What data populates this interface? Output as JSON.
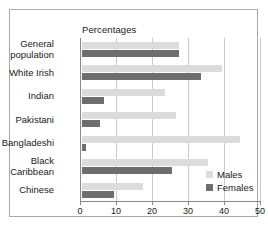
{
  "chart_data": {
    "type": "bar",
    "orientation": "horizontal",
    "title": "Percentages",
    "xlabel": "",
    "ylabel": "",
    "xlim": [
      0,
      50
    ],
    "xticks": [
      0,
      10,
      20,
      30,
      40,
      50
    ],
    "grid": true,
    "legend_position": "inside-right-bottom",
    "categories": [
      "General population",
      "White Irish",
      "Indian",
      "Pakistani",
      "Bangladeshi",
      "Black Caribbean",
      "Chinese"
    ],
    "category_lines": [
      [
        "General",
        "population"
      ],
      [
        "White Irish"
      ],
      [
        "Indian"
      ],
      [
        "Pakistani"
      ],
      [
        "Bangladeshi"
      ],
      [
        "Black",
        "Caribbean"
      ],
      [
        "Chinese"
      ]
    ],
    "series": [
      {
        "name": "Males",
        "color": "#dcdcdc",
        "values": [
          27,
          39,
          23,
          26,
          44,
          35,
          17
        ]
      },
      {
        "name": "Females",
        "color": "#6e6e6e",
        "values": [
          27,
          33,
          6,
          5,
          1,
          25,
          9
        ]
      }
    ]
  },
  "legend": {
    "males_label": "Males",
    "females_label": "Females"
  },
  "axis": {
    "tick_labels": [
      "0",
      "10",
      "20",
      "30",
      "40",
      "50"
    ]
  }
}
